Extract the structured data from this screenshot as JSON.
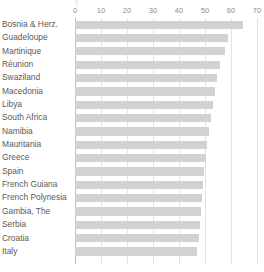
{
  "chart_data": {
    "type": "bar",
    "orientation": "horizontal",
    "title": "",
    "xlabel": "",
    "ylabel": "",
    "xlim": [
      0,
      70
    ],
    "xticks": [
      0,
      10,
      20,
      30,
      40,
      50,
      60,
      70
    ],
    "xtick_labels": [
      "0",
      "10",
      "20",
      "30",
      "40",
      "50",
      "60",
      "70"
    ],
    "grid": true,
    "grid_axis": "x",
    "legend": false,
    "bar_color": "#d2d2d2",
    "axis_color": "#b9b9b9",
    "gridline_color": "#e2e2e2",
    "label_color": "#5a5a5a",
    "tick_color": "#8d8d8d",
    "categories": [
      "Bosnia & Herz.",
      "Guadeloupe",
      "Martinique",
      "Réunion",
      "Swaziland",
      "Macedonia",
      "Libya",
      "South Africa",
      "Namibia",
      "Mauritania",
      "Greece",
      "Spain",
      "French Guiana",
      "French Polynesia",
      "Gambia, The",
      "Serbia",
      "Croatia",
      "Italy"
    ],
    "values": [
      64.6,
      58.8,
      57.7,
      55.8,
      54.6,
      53.8,
      53.1,
      52.3,
      51.5,
      50.8,
      50.4,
      49.6,
      49.2,
      48.8,
      48.5,
      48.1,
      47.7,
      46.9
    ]
  }
}
